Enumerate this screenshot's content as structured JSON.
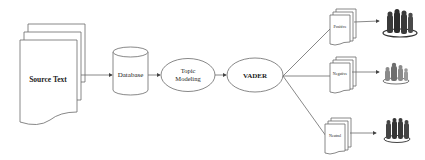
{
  "diagram": {
    "source": {
      "label": "Source Text"
    },
    "database": {
      "label": "Database"
    },
    "topic_modeling": {
      "line1": "Topic",
      "line2": "Modeling"
    },
    "vader": {
      "label": "VADER"
    },
    "outputs": [
      {
        "label": "Positive",
        "icon": "people-group-icon"
      },
      {
        "label": "Negative",
        "icon": "people-group-icon"
      },
      {
        "label": "Neutral",
        "icon": "people-group-icon"
      }
    ]
  },
  "colors": {
    "stroke": "#6a6a6a",
    "people_dark": "#3a3a3a",
    "people_light": "#9a9a9a"
  }
}
